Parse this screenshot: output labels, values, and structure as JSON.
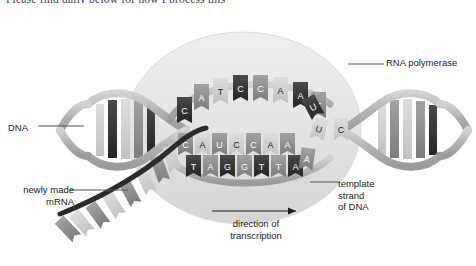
{
  "figure": {
    "title_fragment": "Please find daily below for how I process this",
    "background_color": "#ffffff"
  },
  "labels": {
    "dna": "DNA",
    "newly_made_mrna": "newly made\nmRNA",
    "rna_polymerase": "RNA polymerase",
    "template_strand": "template\nstrand\nof DNA",
    "direction": "direction of\ntranscription"
  },
  "colors": {
    "polymerase_fill": "#e4e4e4",
    "helix_backbone": "#b9b9b9",
    "base_dark": "#3a3a3a",
    "base_mid": "#8f8f8f",
    "base_light": "#cfcfcf",
    "mrna_strand": "#2b2b2b",
    "leader_line": "#555555",
    "text": "#1a1a1a"
  },
  "strands": {
    "coding_strand_bases": [
      "C",
      "A",
      "T",
      "C",
      "C",
      "A",
      "A",
      "T"
    ],
    "mrna_bases": [
      "C",
      "A",
      "U",
      "C",
      "C",
      "A",
      "A"
    ],
    "template_strand_bases": [
      "T",
      "A",
      "G",
      "G",
      "T",
      "T",
      "A"
    ],
    "free_nucleotides": [
      "U",
      "U",
      "A",
      "C"
    ],
    "left_helix_unlabeled_pairs": 5,
    "right_helix_unlabeled_pairs": 5,
    "mrna_tail_unlabeled_bases": 8
  }
}
